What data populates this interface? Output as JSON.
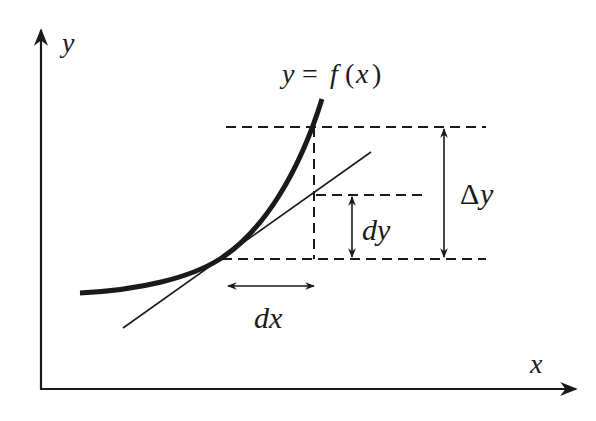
{
  "diagram": {
    "labels": {
      "y_axis": "y",
      "x_axis": "x",
      "curve": "y = f(x)",
      "curve_parts": {
        "lhs": "y",
        "eq": "=",
        "f": "f",
        "open": "(",
        "x": "x",
        "close": ")"
      },
      "delta_y": {
        "delta": "Δ",
        "y": "y"
      },
      "dy": "dy",
      "dx": "dx"
    },
    "elements": [
      "y-axis arrow",
      "x-axis arrow",
      "curve y=f(x) (thick)",
      "tangent line (thin)",
      "dashed horizontal lines at base, tangent height, curve height",
      "dashed vertical line at x+dx",
      "dy double arrow",
      "Δy double arrow",
      "dx double arrow"
    ],
    "colors": {
      "ink": "#1a1a1a",
      "background": "#ffffff"
    }
  }
}
